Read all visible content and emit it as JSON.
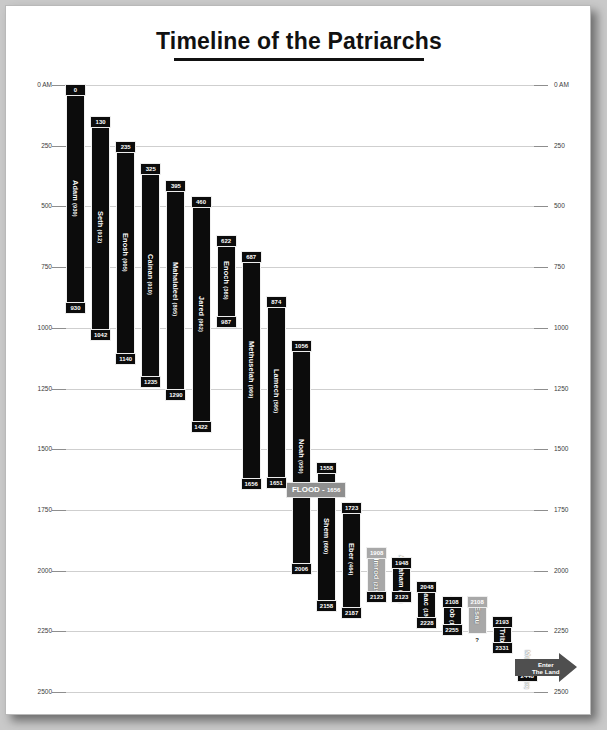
{
  "page": {
    "title": "Timeline of the Patriarchs"
  },
  "chart_data": {
    "type": "bar",
    "orientation": "vertical-gantt",
    "title": "Timeline of the Patriarchs",
    "xlabel": "",
    "ylabel": "",
    "ylim": [
      0,
      2500
    ],
    "axis_ticks": [
      "0 AM",
      "250",
      "500",
      "750",
      "1000",
      "1250",
      "1500",
      "1750",
      "2000",
      "2250",
      "2500"
    ],
    "axis_tick_values": [
      0,
      250,
      500,
      750,
      1000,
      1250,
      1500,
      1750,
      2000,
      2250,
      2500
    ],
    "axis_left_labels": [
      "0 AM",
      "250",
      "500",
      "750",
      "1000",
      "1250",
      "1500",
      "1750",
      "2000",
      "2250",
      "2500"
    ],
    "axis_right_labels": [
      "0 AM",
      "250",
      "500",
      "750",
      "1000",
      "1250",
      "1500",
      "1750",
      "2000",
      "2250",
      "2500"
    ],
    "grid": true,
    "legend": "none",
    "bars": [
      {
        "name": "Adam",
        "lifespan": "(930)",
        "start": 0,
        "end": 930,
        "start_label": "0",
        "end_label": "930",
        "color": "#0c0c0c",
        "col": 0
      },
      {
        "name": "Seth",
        "lifespan": "(912)",
        "start": 130,
        "end": 1042,
        "start_label": "130",
        "end_label": "1042",
        "color": "#0c0c0c",
        "col": 1
      },
      {
        "name": "Enosh",
        "lifespan": "(905)",
        "start": 235,
        "end": 1140,
        "start_label": "235",
        "end_label": "1140",
        "color": "#0c0c0c",
        "col": 2
      },
      {
        "name": "Cainan",
        "lifespan": "(910)",
        "start": 325,
        "end": 1235,
        "start_label": "325",
        "end_label": "1235",
        "color": "#0c0c0c",
        "col": 3
      },
      {
        "name": "Mahalaleel",
        "lifespan": "(895)",
        "start": 395,
        "end": 1290,
        "start_label": "395",
        "end_label": "1290",
        "color": "#0c0c0c",
        "col": 4
      },
      {
        "name": "Jared",
        "lifespan": "(962)",
        "start": 460,
        "end": 1422,
        "start_label": "460",
        "end_label": "1422",
        "color": "#0c0c0c",
        "col": 5
      },
      {
        "name": "Enoch",
        "lifespan": "(365)",
        "start": 622,
        "end": 987,
        "start_label": "622",
        "end_label": "987",
        "color": "#0c0c0c",
        "col": 6
      },
      {
        "name": "Methuselah",
        "lifespan": "(969)",
        "start": 687,
        "end": 1656,
        "start_label": "687",
        "end_label": "1656",
        "color": "#0c0c0c",
        "col": 7
      },
      {
        "name": "Lamech",
        "lifespan": "(595)",
        "start": 874,
        "end": 1651,
        "start_label": "874",
        "end_label": "1651",
        "color": "#0c0c0c",
        "col": 8
      },
      {
        "name": "Noah",
        "lifespan": "(950)",
        "start": 1056,
        "end": 2006,
        "start_label": "1056",
        "end_label": "2006",
        "color": "#0c0c0c",
        "col": 9
      },
      {
        "name": "Shem",
        "lifespan": "(600)",
        "start": 1558,
        "end": 2158,
        "start_label": "1558",
        "end_label": "2158",
        "color": "#0c0c0c",
        "col": 10
      },
      {
        "name": "Eber",
        "lifespan": "(464)",
        "start": 1723,
        "end": 2187,
        "start_label": "1723",
        "end_label": "2187",
        "color": "#0c0c0c",
        "col": 11
      },
      {
        "name": "Nimrod",
        "lifespan": "(215)",
        "start": 1908,
        "end": 2123,
        "start_label": "1908",
        "end_label": "2123",
        "color": "#a8a8a8",
        "col": 12
      },
      {
        "name": "Abraham",
        "lifespan": "(175)",
        "start": 1948,
        "end": 2123,
        "start_label": "1948",
        "end_label": "2123",
        "color": "#0c0c0c",
        "col": 13
      },
      {
        "name": "Isaac",
        "lifespan": "(180)",
        "start": 2048,
        "end": 2228,
        "start_label": "2048",
        "end_label": "2228",
        "color": "#0c0c0c",
        "col": 14
      },
      {
        "name": "Jacob",
        "lifespan": "(145)",
        "start": 2108,
        "end": 2255,
        "start_label": "2108",
        "end_label": "2255",
        "color": "#0c0c0c",
        "col": 15
      },
      {
        "name": "Esau",
        "lifespan": "",
        "start": 2108,
        "end": 2262,
        "start_label": "2108",
        "end_label": "?",
        "color": "#a8a8a8",
        "col": 16
      },
      {
        "name": "12 Tribes",
        "lifespan": "",
        "start": 2193,
        "end": 2331,
        "start_label": "2193",
        "end_label": "2331",
        "color": "#0c0c0c",
        "col": 17
      },
      {
        "name": "Moses",
        "lifespan": "(120)",
        "start": 2368,
        "end": 2448,
        "start_label": "2368",
        "end_label": "2448",
        "color": "#0c0c0c",
        "col": 18
      }
    ],
    "annotations": [
      {
        "id": "flood",
        "label": "FLOOD - ",
        "value": "1656",
        "year": 1656,
        "style": "gray-banner"
      },
      {
        "id": "enter-land",
        "label_line1": "Enter",
        "label_line2": "The Land",
        "year": 2448,
        "style": "gray-arrow"
      }
    ]
  }
}
